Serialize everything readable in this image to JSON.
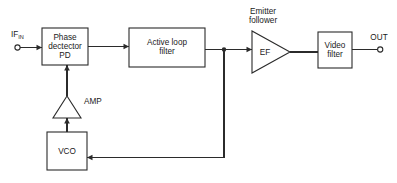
{
  "diagram": {
    "background_color": "#ffffff",
    "line_color": "#2b2b2b",
    "text_color": "#1a1a1a",
    "terminals": {
      "input": {
        "label_main": "IF",
        "label_sub": "IN",
        "name": "if-in-terminal"
      },
      "output": {
        "label": "OUT",
        "name": "out-terminal"
      }
    },
    "blocks": {
      "phase_detector": {
        "line1": "Phase",
        "line2": "dectector",
        "line3": "PD"
      },
      "active_loop_filter": {
        "line1": "Active loop",
        "line2": "filter"
      },
      "emitter_follower": {
        "caption_line1": "Emitter",
        "caption_line2": "follower",
        "symbol_label": "EF"
      },
      "video_filter": {
        "line1": "Video",
        "line2": "filter"
      },
      "amplifier": {
        "label": "AMP"
      },
      "vco": {
        "label": "VCO"
      }
    }
  }
}
